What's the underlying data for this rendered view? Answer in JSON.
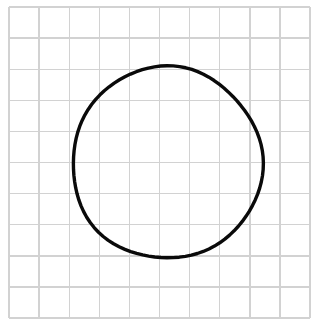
{
  "figure": {
    "background_color": "#ffffff",
    "width": 322,
    "height": 334,
    "caption": ""
  },
  "grid": {
    "name": "square-grid",
    "columns": 10,
    "rows": 10,
    "left": 9,
    "top": 7,
    "right": 310,
    "bottom": 318,
    "cell_width": 30.1,
    "cell_height": 31.1,
    "line_color": "#d2d2d2",
    "line_width": 1.4,
    "label": "Grid background"
  },
  "shape": {
    "name": "circle",
    "type": "circle",
    "center_x": 167,
    "center_y": 163,
    "radius_x": 95,
    "radius_y": 96,
    "stroke_color": "#0a0a0a",
    "stroke_width": 3.4,
    "fill": "none",
    "label": "Circle",
    "diameter_cells": 6.3,
    "hand_drawn": true
  },
  "chart_data": {
    "type": "diagram",
    "xlabel": "",
    "ylabel": "",
    "grid": true,
    "grid_columns": 10,
    "grid_rows": 10,
    "shapes": [
      {
        "kind": "circle",
        "center": [
          167,
          163
        ],
        "radius": 95.5,
        "stroke": "#0a0a0a",
        "fill": "none"
      }
    ]
  }
}
